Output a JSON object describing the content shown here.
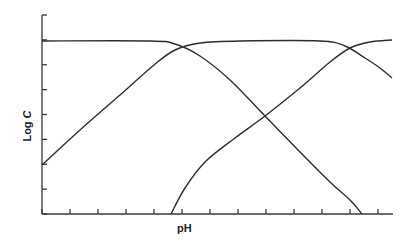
{
  "chart_data": {
    "type": "line",
    "title": "",
    "xlabel": "pH",
    "ylabel": "Log C",
    "ylabel_parts": {
      "text": "Log ",
      "italic": "C"
    },
    "x_ticks_count": 13,
    "y_ticks_count": 9,
    "tick_labels": "none",
    "grid": false,
    "legend": "none",
    "plot_px": {
      "x0": 42,
      "x1": 392,
      "y_top": 15,
      "y_bottom": 214
    },
    "series": [
      {
        "name": "species-1 (fully protonated)",
        "shape": "flat then falling",
        "points": [
          [
            42,
            41
          ],
          [
            150,
            41
          ],
          [
            175,
            44
          ],
          [
            200,
            56
          ],
          [
            230,
            80
          ],
          [
            265,
            116
          ],
          [
            300,
            152
          ],
          [
            330,
            182
          ],
          [
            350,
            200
          ],
          [
            362,
            214
          ]
        ]
      },
      {
        "name": "species-2 (intermediate)",
        "shape": "rising, plateau, falling",
        "points": [
          [
            42,
            165
          ],
          [
            80,
            130
          ],
          [
            120,
            95
          ],
          [
            154,
            65
          ],
          [
            175,
            50
          ],
          [
            200,
            43
          ],
          [
            240,
            41
          ],
          [
            320,
            41
          ],
          [
            345,
            46
          ],
          [
            365,
            58
          ],
          [
            380,
            68
          ],
          [
            392,
            78
          ]
        ]
      },
      {
        "name": "species-3 (fully deprotonated)",
        "shape": "rising then flat",
        "points": [
          [
            171,
            214
          ],
          [
            185,
            188
          ],
          [
            205,
            162
          ],
          [
            235,
            138
          ],
          [
            265,
            116
          ],
          [
            300,
            88
          ],
          [
            330,
            62
          ],
          [
            350,
            48
          ],
          [
            370,
            42
          ],
          [
            392,
            40
          ]
        ]
      }
    ],
    "crossings_px": [
      [
        182,
        48
      ],
      [
        265,
        116
      ],
      [
        350,
        48
      ]
    ]
  },
  "labels": {
    "ylabel_main": "Log ",
    "ylabel_italic": "C",
    "xlabel": "pH"
  }
}
